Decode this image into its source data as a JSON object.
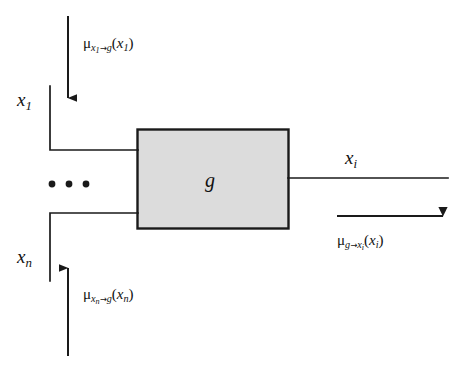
{
  "diagram": {
    "type": "factor-graph-message-passing",
    "node": {
      "name": "g",
      "label": "g",
      "shape": "rectangle",
      "fill_color": "#dcdcdc",
      "stroke_color": "#1a1a1a",
      "bounds": {
        "x": 137,
        "y": 129,
        "width": 151,
        "height": 99
      }
    },
    "variables": [
      {
        "id": "x1",
        "base": "x",
        "subscript": "1",
        "role": "input",
        "wire_y": 150
      },
      {
        "id": "xn",
        "base": "x",
        "subscript": "n",
        "role": "input",
        "wire_y": 213
      },
      {
        "id": "xi",
        "base": "x",
        "subscript": "i",
        "role": "output",
        "wire_y": 178
      }
    ],
    "messages": [
      {
        "id": "mu-x1-to-g",
        "mu": "μ",
        "from": "x",
        "from_sub": "1",
        "to": "g",
        "argument": "x",
        "argument_sub": "1",
        "direction": "down",
        "arrow_glyph": "→"
      },
      {
        "id": "mu-xn-to-g",
        "mu": "μ",
        "from": "x",
        "from_sub": "n",
        "to": "g",
        "argument": "x",
        "argument_sub": "n",
        "direction": "up",
        "arrow_glyph": "→"
      },
      {
        "id": "mu-g-to-xi",
        "mu": "μ",
        "from": "g",
        "from_sub": "",
        "to": "x",
        "to_sub": "i",
        "argument": "x",
        "argument_sub": "i",
        "direction": "right",
        "arrow_glyph": "→"
      }
    ],
    "ellipsis": {
      "label": "• • •",
      "meaning": "additional-input-variables"
    },
    "colors": {
      "ink": "#1a1a1a",
      "node_fill": "#dcdcdc",
      "background": "#ffffff"
    }
  }
}
